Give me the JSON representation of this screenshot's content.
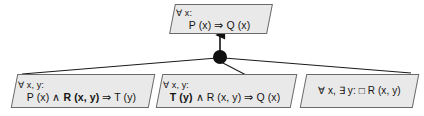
{
  "diagram": {
    "background_color": "#ffffff",
    "node_fill_color": "#e9e9e9",
    "node_border_color": "#6a6a6a",
    "connector_color": "#1a1a1a",
    "junction": {
      "shape": "filled-circle",
      "color": "#111111",
      "label": "and-junction"
    },
    "root": {
      "id": "root-goal",
      "quantifier_line": "∀ x:",
      "body_line_plain": "P (x) ⇒ Q (x)",
      "body_parts": [
        {
          "text": "P (x) ⇒ Q (x)",
          "bold": false
        }
      ]
    },
    "children": [
      {
        "id": "subgoal-left",
        "quantifier_line": "∀ x, y:",
        "body_line_plain": "P (x) ∧ R (x, y) ⇒ T (y)",
        "body_parts": [
          {
            "text": "P (x) ∧ ",
            "bold": false
          },
          {
            "text": "R (x, y)",
            "bold": true
          },
          {
            "text": " ⇒ T (y)",
            "bold": false
          }
        ]
      },
      {
        "id": "subgoal-middle",
        "quantifier_line": "∀ x, y:",
        "body_line_plain": "T (y) ∧ R (x, y) ⇒ Q (x)",
        "body_parts": [
          {
            "text": "T (y)",
            "bold": true
          },
          {
            "text": " ∧ R (x, y) ⇒ Q (x)",
            "bold": false
          }
        ]
      },
      {
        "id": "subgoal-right",
        "quantifier_line": "",
        "body_line_plain": "∀ x, ∃ y: □ R (x, y)",
        "body_parts": [
          {
            "text": "∀ x, ∃ y: □ R (x, y)",
            "bold": false
          }
        ]
      }
    ]
  }
}
